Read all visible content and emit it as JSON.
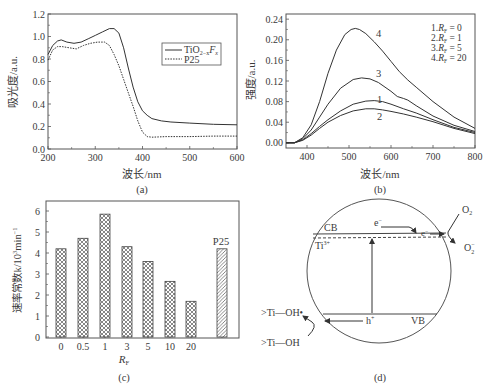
{
  "chart_data": [
    {
      "panel": "a",
      "type": "line",
      "caption": "(a)",
      "title": "",
      "xlabel": "波长/nm",
      "ylabel": "吸光度/a.u.",
      "xlim": [
        200,
        600
      ],
      "ylim": [
        0.0,
        1.2
      ],
      "xticks": [
        200,
        300,
        400,
        500,
        600
      ],
      "yticks": [
        "0.0",
        "0.2",
        "0.4",
        "0.6",
        "0.8",
        "1.0",
        "1.2"
      ],
      "legend": {
        "position": "upper right",
        "entries": [
          "TiO2-xFx",
          "P25"
        ]
      },
      "series": [
        {
          "name": "TiO2-xFx",
          "style": "solid",
          "x": [
            200,
            210,
            220,
            228,
            240,
            255,
            270,
            285,
            300,
            315,
            330,
            340,
            350,
            360,
            370,
            380,
            390,
            400,
            410,
            420,
            440,
            460,
            500,
            550,
            600
          ],
          "y": [
            0.84,
            0.92,
            0.96,
            0.97,
            0.95,
            0.94,
            0.95,
            0.98,
            1.01,
            1.04,
            1.07,
            1.07,
            1.03,
            0.9,
            0.72,
            0.55,
            0.42,
            0.34,
            0.3,
            0.27,
            0.25,
            0.24,
            0.23,
            0.22,
            0.215
          ]
        },
        {
          "name": "P25",
          "style": "dashed",
          "x": [
            200,
            210,
            220,
            230,
            245,
            260,
            275,
            290,
            305,
            320,
            330,
            340,
            350,
            360,
            370,
            380,
            390,
            400,
            410,
            420,
            450,
            500,
            550,
            600
          ],
          "y": [
            0.79,
            0.88,
            0.91,
            0.91,
            0.9,
            0.89,
            0.92,
            0.94,
            0.95,
            0.95,
            0.92,
            0.84,
            0.74,
            0.62,
            0.5,
            0.38,
            0.25,
            0.15,
            0.11,
            0.105,
            0.11,
            0.11,
            0.115,
            0.115
          ]
        }
      ]
    },
    {
      "panel": "b",
      "type": "line",
      "caption": "(b)",
      "title": "",
      "xlabel": "波长/nm",
      "ylabel": "强度/a.u.",
      "xlim": [
        350,
        800
      ],
      "ylim": [
        -0.01,
        0.25
      ],
      "xticks": [
        400,
        500,
        600,
        700,
        800
      ],
      "yticks": [
        "0.00",
        "0.04",
        "0.08",
        "0.12",
        "0.16",
        "0.20",
        "0.24"
      ],
      "legend": {
        "position": "upper right",
        "entries": [
          "1.RF = 0",
          "2.RF = 1",
          "3.RF = 5",
          "4.RF = 20"
        ]
      },
      "series": [
        {
          "name": "1.RF = 0",
          "label": "1",
          "x": [
            350,
            370,
            390,
            410,
            430,
            450,
            480,
            510,
            540,
            560,
            580,
            600,
            630,
            660,
            700,
            750,
            800
          ],
          "y": [
            0.0,
            0.0,
            0.006,
            0.018,
            0.032,
            0.045,
            0.062,
            0.075,
            0.081,
            0.082,
            0.08,
            0.075,
            0.066,
            0.058,
            0.045,
            0.03,
            0.02
          ]
        },
        {
          "name": "2.RF = 1",
          "label": "2",
          "x": [
            350,
            370,
            390,
            410,
            430,
            450,
            480,
            510,
            540,
            560,
            580,
            600,
            630,
            660,
            700,
            750,
            800
          ],
          "y": [
            0.0,
            0.0,
            0.005,
            0.015,
            0.028,
            0.04,
            0.053,
            0.062,
            0.066,
            0.066,
            0.064,
            0.061,
            0.056,
            0.05,
            0.041,
            0.028,
            0.018
          ]
        },
        {
          "name": "3.RF = 5",
          "label": "3",
          "x": [
            350,
            370,
            390,
            410,
            430,
            450,
            480,
            510,
            530,
            550,
            570,
            600,
            615,
            630,
            640,
            660,
            700,
            750,
            800
          ],
          "y": [
            0.0,
            0.0,
            0.008,
            0.025,
            0.05,
            0.075,
            0.106,
            0.123,
            0.126,
            0.124,
            0.117,
            0.1,
            0.09,
            0.086,
            0.083,
            0.072,
            0.052,
            0.034,
            0.022
          ]
        },
        {
          "name": "4.RF = 20",
          "label": "4",
          "x": [
            350,
            370,
            390,
            410,
            430,
            450,
            470,
            490,
            505,
            515,
            525,
            540,
            560,
            580,
            600,
            620,
            640,
            660,
            700,
            750,
            800
          ],
          "y": [
            0.0,
            0.0,
            0.01,
            0.035,
            0.08,
            0.135,
            0.18,
            0.21,
            0.22,
            0.222,
            0.22,
            0.212,
            0.196,
            0.178,
            0.158,
            0.138,
            0.122,
            0.108,
            0.08,
            0.05,
            0.028
          ]
        }
      ]
    },
    {
      "panel": "c",
      "type": "bar",
      "caption": "(c)",
      "title": "",
      "xlabel": "RF",
      "ylabel": "速率常数k/10³min⁻¹",
      "ylim": [
        0,
        6.5
      ],
      "yticks": [
        "0",
        "1",
        "2",
        "3",
        "4",
        "5",
        "6"
      ],
      "categories": [
        "0",
        "0.5",
        "1",
        "3",
        "5",
        "10",
        "20",
        "P25"
      ],
      "values": [
        4.2,
        4.7,
        5.85,
        4.3,
        3.6,
        2.65,
        1.7,
        4.2
      ],
      "patterns": [
        "crosshatch",
        "crosshatch",
        "crosshatch",
        "crosshatch",
        "crosshatch",
        "crosshatch",
        "crosshatch",
        "diagonal"
      ],
      "annotations": [
        {
          "text": "P25",
          "target": "P25"
        }
      ]
    }
  ],
  "figure": {
    "panel_a": {
      "caption": "(a)",
      "xlabel": "波长/nm",
      "ylabel": "吸光度/a.u.",
      "xtick_labels": [
        "200",
        "300",
        "400",
        "500",
        "600"
      ],
      "ytick_labels": [
        "0.0",
        "0.2",
        "0.4",
        "0.6",
        "0.8",
        "1.0",
        "1.2"
      ],
      "legend": {
        "tio2_main": "TiO",
        "tio2_sub1": "2−x",
        "tio2_f": "F",
        "tio2_sub2": "x",
        "p25": "P25"
      }
    },
    "panel_b": {
      "caption": "(b)",
      "xlabel": "波长/nm",
      "ylabel": "强度/a.u.",
      "xtick_labels": [
        "400",
        "500",
        "600",
        "700",
        "800"
      ],
      "ytick_labels": [
        "0.00",
        "0.04",
        "0.08",
        "0.12",
        "0.16",
        "0.20",
        "0.24"
      ],
      "curve_labels": [
        "1",
        "2",
        "3",
        "4"
      ],
      "legend": [
        {
          "num": "1.",
          "var": "R",
          "sub": "F",
          "val": " = 0"
        },
        {
          "num": "2.",
          "var": "R",
          "sub": "F",
          "val": " = 1"
        },
        {
          "num": "3.",
          "var": "R",
          "sub": "F",
          "val": " = 5"
        },
        {
          "num": "4.",
          "var": "R",
          "sub": "F",
          "val": " = 20"
        }
      ]
    },
    "panel_c": {
      "caption": "(c)",
      "xlabel_var": "R",
      "xlabel_sub": "F",
      "ylabel_main": "速率常数k/10",
      "ylabel_sup": "3",
      "ylabel_unit": "min",
      "ylabel_sup2": "−1",
      "ytick_labels": [
        "0",
        "1",
        "2",
        "3",
        "4",
        "5",
        "6"
      ],
      "xtick_labels": [
        "0",
        "0.5",
        "1",
        "3",
        "5",
        "10",
        "20"
      ],
      "p25_label": "P25"
    },
    "panel_d": {
      "caption": "(d)",
      "cb": "CB",
      "vb": "VB",
      "ti3": "Ti",
      "ti3_sup": "3+",
      "e_minus": "e",
      "e_sup": "−",
      "h_plus": "h",
      "h_sup": "+",
      "o2": "O",
      "o2_sub": "2",
      "o2m": "O",
      "o2m_sub": "2",
      "o2m_sup": "−",
      "tioh_radical": ">Ti—OH•",
      "tioh": ">Ti—OH"
    },
    "colors": {
      "line": "#3a3a3a",
      "frame": "#555555",
      "text": "#3a3a3a"
    }
  }
}
